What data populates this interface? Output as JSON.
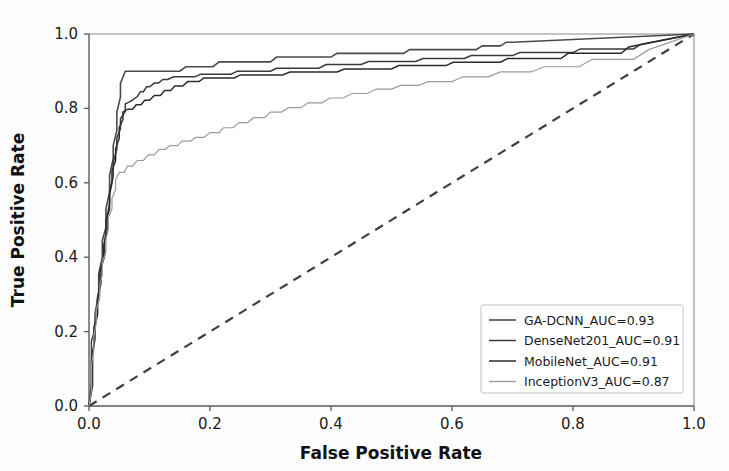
{
  "chart_data": {
    "type": "line",
    "title": "",
    "xlabel": "False Positive Rate",
    "ylabel": "True Positive Rate",
    "xlim": [
      0.0,
      1.0
    ],
    "ylim": [
      0.0,
      1.0
    ],
    "xticks": [
      "0.0",
      "0.2",
      "0.4",
      "0.6",
      "0.8",
      "1.0"
    ],
    "yticks": [
      "0.0",
      "0.2",
      "0.4",
      "0.6",
      "0.8",
      "1.0"
    ],
    "xtick_values": [
      0.0,
      0.2,
      0.4,
      0.6,
      0.8,
      1.0
    ],
    "ytick_values": [
      0.0,
      0.2,
      0.4,
      0.6,
      0.8,
      1.0
    ],
    "grid": false,
    "legend_position": "lower right",
    "reference_line": {
      "name": "chance-diagonal",
      "style": "dashed",
      "color": "#3f3f3f",
      "points": [
        [
          0.0,
          0.0
        ],
        [
          1.0,
          1.0
        ]
      ]
    },
    "series": [
      {
        "name": "GA-DCNN",
        "auc": "0.93",
        "legend_label": "GA-DCNN_AUC=0.93",
        "color": "#4a4a4a",
        "width": 1.6,
        "points": [
          [
            0.0,
            0.0
          ],
          [
            0.004,
            0.06
          ],
          [
            0.004,
            0.175
          ],
          [
            0.01,
            0.205
          ],
          [
            0.01,
            0.25
          ],
          [
            0.016,
            0.3
          ],
          [
            0.016,
            0.355
          ],
          [
            0.022,
            0.4
          ],
          [
            0.022,
            0.445
          ],
          [
            0.028,
            0.48
          ],
          [
            0.028,
            0.53
          ],
          [
            0.034,
            0.575
          ],
          [
            0.034,
            0.62
          ],
          [
            0.04,
            0.665
          ],
          [
            0.04,
            0.7
          ],
          [
            0.046,
            0.74
          ],
          [
            0.046,
            0.79
          ],
          [
            0.052,
            0.83
          ],
          [
            0.052,
            0.868
          ],
          [
            0.06,
            0.9
          ],
          [
            0.15,
            0.9
          ],
          [
            0.16,
            0.912
          ],
          [
            0.205,
            0.912
          ],
          [
            0.215,
            0.925
          ],
          [
            0.3,
            0.925
          ],
          [
            0.31,
            0.938
          ],
          [
            0.4,
            0.938
          ],
          [
            0.41,
            0.948
          ],
          [
            0.52,
            0.948
          ],
          [
            0.53,
            0.958
          ],
          [
            0.64,
            0.958
          ],
          [
            0.65,
            0.968
          ],
          [
            0.68,
            0.968
          ],
          [
            0.69,
            0.978
          ],
          [
            0.7,
            0.978
          ],
          [
            1.0,
            1.0
          ]
        ]
      },
      {
        "name": "DenseNet201",
        "auc": "0.91",
        "legend_label": "DenseNet201_AUC=0.91",
        "color": "#3a3a3a",
        "width": 1.5,
        "points": [
          [
            0.0,
            0.0
          ],
          [
            0.006,
            0.055
          ],
          [
            0.006,
            0.14
          ],
          [
            0.01,
            0.18
          ],
          [
            0.01,
            0.215
          ],
          [
            0.014,
            0.245
          ],
          [
            0.014,
            0.29
          ],
          [
            0.02,
            0.33
          ],
          [
            0.02,
            0.372
          ],
          [
            0.026,
            0.405
          ],
          [
            0.026,
            0.44
          ],
          [
            0.03,
            0.472
          ],
          [
            0.03,
            0.51
          ],
          [
            0.034,
            0.545
          ],
          [
            0.034,
            0.58
          ],
          [
            0.04,
            0.615
          ],
          [
            0.04,
            0.655
          ],
          [
            0.046,
            0.69
          ],
          [
            0.046,
            0.72
          ],
          [
            0.052,
            0.745
          ],
          [
            0.052,
            0.772
          ],
          [
            0.06,
            0.792
          ],
          [
            0.06,
            0.812
          ],
          [
            0.07,
            0.82
          ],
          [
            0.08,
            0.832
          ],
          [
            0.085,
            0.845
          ],
          [
            0.09,
            0.845
          ],
          [
            0.095,
            0.858
          ],
          [
            0.1,
            0.858
          ],
          [
            0.108,
            0.868
          ],
          [
            0.115,
            0.868
          ],
          [
            0.122,
            0.878
          ],
          [
            0.13,
            0.878
          ],
          [
            0.14,
            0.885
          ],
          [
            0.175,
            0.885
          ],
          [
            0.185,
            0.892
          ],
          [
            0.235,
            0.892
          ],
          [
            0.245,
            0.9
          ],
          [
            0.3,
            0.9
          ],
          [
            0.31,
            0.908
          ],
          [
            0.38,
            0.908
          ],
          [
            0.392,
            0.918
          ],
          [
            0.45,
            0.918
          ],
          [
            0.462,
            0.926
          ],
          [
            0.54,
            0.926
          ],
          [
            0.552,
            0.934
          ],
          [
            0.62,
            0.934
          ],
          [
            0.632,
            0.942
          ],
          [
            0.7,
            0.942
          ],
          [
            0.712,
            0.95
          ],
          [
            0.8,
            0.95
          ],
          [
            0.812,
            0.96
          ],
          [
            0.9,
            0.96
          ],
          [
            0.912,
            0.972
          ],
          [
            1.0,
            1.0
          ]
        ]
      },
      {
        "name": "MobileNet",
        "auc": "0.91",
        "legend_label": "MobileNet_AUC=0.91",
        "color": "#2b2b2b",
        "width": 1.5,
        "points": [
          [
            0.0,
            0.0
          ],
          [
            0.004,
            0.048
          ],
          [
            0.004,
            0.12
          ],
          [
            0.008,
            0.165
          ],
          [
            0.008,
            0.21
          ],
          [
            0.014,
            0.248
          ],
          [
            0.014,
            0.288
          ],
          [
            0.018,
            0.322
          ],
          [
            0.018,
            0.36
          ],
          [
            0.024,
            0.395
          ],
          [
            0.024,
            0.43
          ],
          [
            0.028,
            0.462
          ],
          [
            0.028,
            0.498
          ],
          [
            0.034,
            0.53
          ],
          [
            0.034,
            0.568
          ],
          [
            0.038,
            0.6
          ],
          [
            0.038,
            0.632
          ],
          [
            0.044,
            0.66
          ],
          [
            0.044,
            0.692
          ],
          [
            0.05,
            0.72
          ],
          [
            0.05,
            0.748
          ],
          [
            0.056,
            0.77
          ],
          [
            0.056,
            0.79
          ],
          [
            0.064,
            0.798
          ],
          [
            0.072,
            0.798
          ],
          [
            0.078,
            0.81
          ],
          [
            0.086,
            0.81
          ],
          [
            0.092,
            0.822
          ],
          [
            0.1,
            0.822
          ],
          [
            0.108,
            0.835
          ],
          [
            0.118,
            0.835
          ],
          [
            0.125,
            0.848
          ],
          [
            0.135,
            0.848
          ],
          [
            0.142,
            0.86
          ],
          [
            0.155,
            0.86
          ],
          [
            0.163,
            0.872
          ],
          [
            0.182,
            0.872
          ],
          [
            0.19,
            0.882
          ],
          [
            0.24,
            0.882
          ],
          [
            0.25,
            0.89
          ],
          [
            0.32,
            0.89
          ],
          [
            0.332,
            0.898
          ],
          [
            0.41,
            0.898
          ],
          [
            0.422,
            0.906
          ],
          [
            0.5,
            0.906
          ],
          [
            0.512,
            0.915
          ],
          [
            0.59,
            0.915
          ],
          [
            0.602,
            0.924
          ],
          [
            0.68,
            0.924
          ],
          [
            0.692,
            0.934
          ],
          [
            0.78,
            0.934
          ],
          [
            0.792,
            0.948
          ],
          [
            0.88,
            0.948
          ],
          [
            0.892,
            0.965
          ],
          [
            1.0,
            1.0
          ]
        ]
      },
      {
        "name": "InceptionV3",
        "auc": "0.87",
        "legend_label": "InceptionV3_AUC=0.87",
        "color": "#9a9a9a",
        "width": 1.2,
        "points": [
          [
            0.0,
            0.0
          ],
          [
            0.004,
            0.04
          ],
          [
            0.004,
            0.11
          ],
          [
            0.008,
            0.15
          ],
          [
            0.008,
            0.19
          ],
          [
            0.012,
            0.222
          ],
          [
            0.012,
            0.258
          ],
          [
            0.018,
            0.29
          ],
          [
            0.018,
            0.325
          ],
          [
            0.022,
            0.352
          ],
          [
            0.022,
            0.385
          ],
          [
            0.028,
            0.415
          ],
          [
            0.028,
            0.448
          ],
          [
            0.032,
            0.475
          ],
          [
            0.032,
            0.505
          ],
          [
            0.038,
            0.53
          ],
          [
            0.038,
            0.558
          ],
          [
            0.044,
            0.582
          ],
          [
            0.044,
            0.608
          ],
          [
            0.05,
            0.628
          ],
          [
            0.058,
            0.628
          ],
          [
            0.064,
            0.645
          ],
          [
            0.072,
            0.645
          ],
          [
            0.08,
            0.66
          ],
          [
            0.09,
            0.66
          ],
          [
            0.098,
            0.675
          ],
          [
            0.108,
            0.675
          ],
          [
            0.116,
            0.69
          ],
          [
            0.126,
            0.69
          ],
          [
            0.134,
            0.7
          ],
          [
            0.146,
            0.7
          ],
          [
            0.154,
            0.712
          ],
          [
            0.168,
            0.712
          ],
          [
            0.176,
            0.722
          ],
          [
            0.19,
            0.722
          ],
          [
            0.2,
            0.735
          ],
          [
            0.215,
            0.735
          ],
          [
            0.222,
            0.748
          ],
          [
            0.238,
            0.748
          ],
          [
            0.248,
            0.762
          ],
          [
            0.262,
            0.762
          ],
          [
            0.272,
            0.775
          ],
          [
            0.29,
            0.775
          ],
          [
            0.3,
            0.79
          ],
          [
            0.318,
            0.79
          ],
          [
            0.33,
            0.802
          ],
          [
            0.35,
            0.802
          ],
          [
            0.362,
            0.815
          ],
          [
            0.385,
            0.815
          ],
          [
            0.398,
            0.828
          ],
          [
            0.42,
            0.828
          ],
          [
            0.435,
            0.84
          ],
          [
            0.46,
            0.84
          ],
          [
            0.475,
            0.852
          ],
          [
            0.5,
            0.852
          ],
          [
            0.515,
            0.862
          ],
          [
            0.545,
            0.862
          ],
          [
            0.56,
            0.872
          ],
          [
            0.6,
            0.872
          ],
          [
            0.618,
            0.885
          ],
          [
            0.66,
            0.885
          ],
          [
            0.68,
            0.898
          ],
          [
            0.73,
            0.898
          ],
          [
            0.752,
            0.912
          ],
          [
            0.81,
            0.912
          ],
          [
            0.832,
            0.932
          ],
          [
            0.9,
            0.932
          ],
          [
            0.925,
            0.958
          ],
          [
            1.0,
            1.0
          ]
        ]
      }
    ]
  },
  "legend": {
    "entries": [
      "GA-DCNN_AUC=0.93",
      "DenseNet201_AUC=0.91",
      "MobileNet_AUC=0.91",
      "InceptionV3_AUC=0.87"
    ]
  }
}
